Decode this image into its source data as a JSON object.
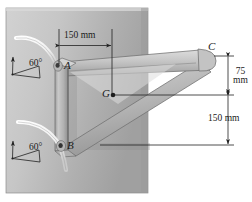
{
  "figure": {
    "type": "engineering-statics-diagram"
  },
  "dimensions": {
    "horizontal_150": "150 mm",
    "vertical_75_value": "75",
    "vertical_75_unit": "mm",
    "vertical_150": "150 mm"
  },
  "angles": {
    "upper": "60°",
    "lower": "60°"
  },
  "points": {
    "a": "A",
    "b": "B",
    "c": "C",
    "g": "G"
  },
  "colors": {
    "plate_light": "#cfcfcf",
    "plate_dark": "#a6a6a6",
    "bracket_light": "#d6d6d6",
    "bracket_mid": "#b4b4b4",
    "bracket_dark": "#9a9a9a",
    "cable": "#f2f2f2",
    "line": "#2b2b2b",
    "background": "#ffffff"
  }
}
